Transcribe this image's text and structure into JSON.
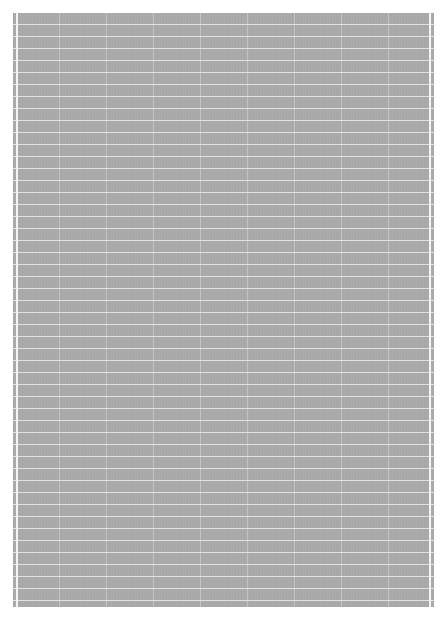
{
  "image": {
    "description": "Gray grid-paper texture with thin light horizontal and vertical rules on a white background",
    "colors": {
      "background": "#ffffff",
      "sheet": "#a9a9a9",
      "horizontal_rule": "#ebebeb",
      "vertical_rule": "#d7d7d7",
      "edge_stripe": "#f4f4f4"
    },
    "grid": {
      "row_spacing_px": 12,
      "column_spacing_px": 47
    }
  }
}
